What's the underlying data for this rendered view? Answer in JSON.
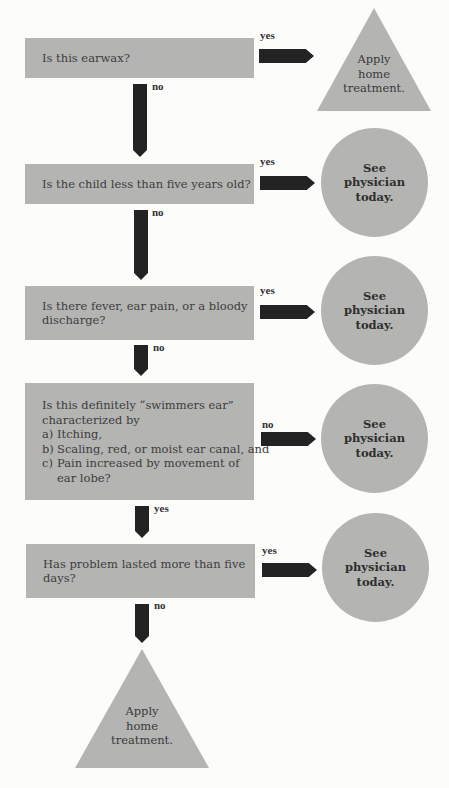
{
  "flowchart": {
    "questions": [
      {
        "id": "q1",
        "lines": [
          "Is this earwax?"
        ]
      },
      {
        "id": "q2",
        "lines": [
          "Is the child less than five years old?"
        ]
      },
      {
        "id": "q3",
        "lines": [
          "Is there fever, ear pain, or a bloody",
          "discharge?"
        ]
      },
      {
        "id": "q4",
        "lines": [
          "Is this definitely “swimmers ear”",
          "characterized by"
        ],
        "items": [
          {
            "mark": "a)",
            "text": "Itching,"
          },
          {
            "mark": "b)",
            "text": "Scaling, red, or moist ear canal, and"
          },
          {
            "mark": "c)",
            "text": "Pain increased by movement of"
          }
        ],
        "continuation": "ear lobe?"
      },
      {
        "id": "q5",
        "lines": [
          "Has problem lasted more than five",
          "days?"
        ]
      }
    ],
    "side_labels": [
      "yes",
      "yes",
      "yes",
      "no",
      "yes"
    ],
    "down_labels": [
      "no",
      "no",
      "no",
      "yes",
      "no"
    ],
    "outcomes": {
      "home_treatment": [
        "Apply",
        "home",
        "treatment."
      ],
      "see_physician": [
        "See",
        "physician",
        "today."
      ]
    },
    "colors": {
      "shape_fill": "#b4b4b2",
      "arrow_fill": "#232323",
      "background": "#fcfcfb"
    }
  }
}
